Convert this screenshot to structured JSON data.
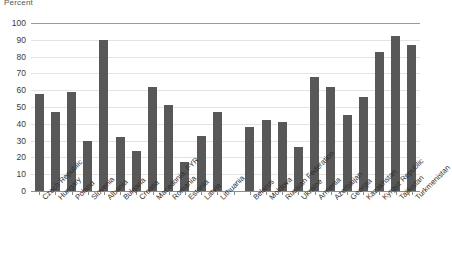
{
  "chart": {
    "title": "Percent",
    "ylabel": "Percent",
    "xlabel": ""
  },
  "axis": {
    "y_ticks": [
      "100",
      "90",
      "80",
      "70",
      "60",
      "50",
      "40",
      "30",
      "20",
      "10",
      "0"
    ]
  },
  "chart_data": {
    "type": "bar",
    "title": "Percent",
    "subtitle": "",
    "xlabel": "",
    "ylabel": "Percent",
    "ylim": [
      0,
      100
    ],
    "ytick_values": [
      0,
      10,
      20,
      30,
      40,
      50,
      60,
      70,
      80,
      90,
      100
    ],
    "grid": true,
    "legend": "none",
    "bar_color": "#585858",
    "categories": [
      "Czech Republic",
      "Hungary",
      "Poland",
      "Slovenia",
      "Albania",
      "Bulgaria",
      "Croatia",
      "Macedonia, FYR",
      "Romania",
      "Estonia",
      "Latvia",
      "Lithuania",
      "Belarus",
      "Moldova",
      "Russian Federation",
      "Ukraine",
      "Armenia",
      "Azerbaijan",
      "Georgia",
      "Kazakhstan",
      "Kyrgyz Republic",
      "Tajikistan",
      "Turkmenistan"
    ],
    "values": [
      58,
      47,
      59,
      30,
      90,
      32,
      24,
      62,
      51,
      17,
      33,
      47,
      38,
      42,
      41,
      26,
      68,
      62,
      45,
      56,
      83,
      92,
      87
    ],
    "group_gaps_after": [
      "Lithuania"
    ]
  }
}
